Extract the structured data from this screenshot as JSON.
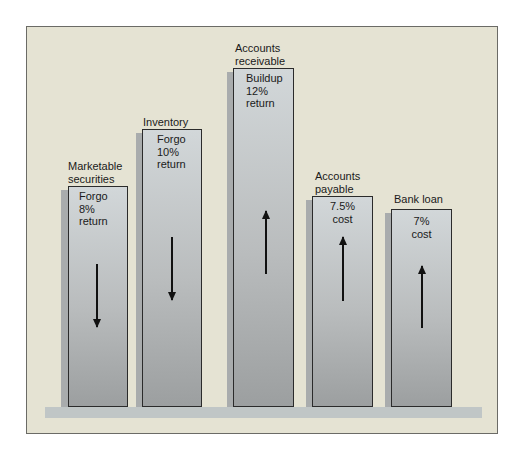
{
  "diagram": {
    "bars": [
      {
        "label_line1": "Marketable",
        "label_line2": "securities",
        "text": [
          "Forgo",
          "8%",
          "return"
        ],
        "direction": "down"
      },
      {
        "label_line1": "Inventory",
        "label_line2": "",
        "text": [
          "Forgo",
          "10%",
          "return"
        ],
        "direction": "down"
      },
      {
        "label_line1": "Accounts",
        "label_line2": "receivable",
        "text": [
          "Buildup",
          "12%",
          "return"
        ],
        "direction": "up"
      },
      {
        "label_line1": "Accounts",
        "label_line2": "payable",
        "text": [
          "7.5%",
          "cost",
          ""
        ],
        "direction": "up"
      },
      {
        "label_line1": "Bank loan",
        "label_line2": "",
        "text": [
          "7%",
          "cost",
          ""
        ],
        "direction": "up"
      }
    ],
    "colors": {
      "panel_bg": "#e5e3d3",
      "bar_fill": "#b9bcbd",
      "base_strip": "#c0c6c6",
      "arrow": "#111111"
    }
  }
}
